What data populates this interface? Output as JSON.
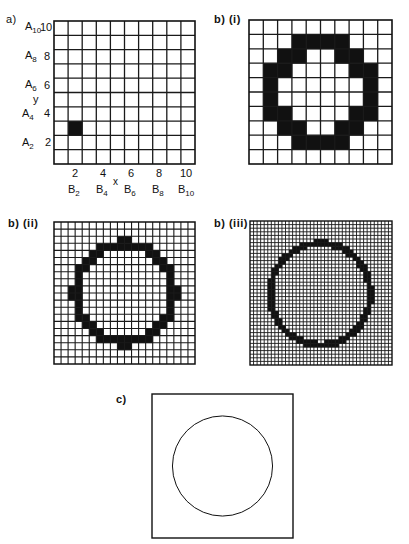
{
  "panels": {
    "a": {
      "label": "a)",
      "grid_size": 10,
      "y_axis": {
        "title": "y",
        "ticks": [
          {
            "value": "10",
            "name": "A",
            "sub": "10"
          },
          {
            "value": "8",
            "name": "A",
            "sub": "8"
          },
          {
            "value": "6",
            "name": "A",
            "sub": "6"
          },
          {
            "value": "4",
            "name": "A",
            "sub": "4"
          },
          {
            "value": "2",
            "name": "A",
            "sub": "2"
          }
        ]
      },
      "x_axis": {
        "title": "x",
        "ticks": [
          {
            "value": "2",
            "name": "B",
            "sub": "2"
          },
          {
            "value": "4",
            "name": "B",
            "sub": "4"
          },
          {
            "value": "6",
            "name": "B",
            "sub": "6"
          },
          {
            "value": "8",
            "name": "B",
            "sub": "8"
          },
          {
            "value": "10",
            "name": "B",
            "sub": "10"
          }
        ]
      },
      "filled_cells": [
        [
          2,
          3
        ]
      ]
    },
    "b1": {
      "label": "b) (i)",
      "grid_size": 10,
      "filled_rows": [
        [],
        [
          3,
          4,
          5,
          6
        ],
        [
          2,
          3,
          6,
          7
        ],
        [
          1,
          2,
          7,
          8
        ],
        [
          1,
          8
        ],
        [
          1,
          8
        ],
        [
          1,
          2,
          7,
          8
        ],
        [
          2,
          3,
          6,
          7
        ],
        [
          3,
          4,
          5,
          6
        ],
        []
      ]
    },
    "b2": {
      "label": "b) (ii)",
      "grid_size": 20,
      "filled_rows": [
        [],
        [],
        [
          9,
          10
        ],
        [
          6,
          7,
          8,
          9,
          10,
          11,
          12,
          13
        ],
        [
          5,
          6,
          13,
          14
        ],
        [
          4,
          5,
          14,
          15
        ],
        [
          3,
          4,
          15,
          16
        ],
        [
          3,
          16
        ],
        [
          3,
          16
        ],
        [
          2,
          3,
          16,
          17
        ],
        [
          2,
          3,
          16,
          17
        ],
        [
          3,
          16
        ],
        [
          3,
          16
        ],
        [
          3,
          4,
          15,
          16
        ],
        [
          4,
          5,
          14,
          15
        ],
        [
          5,
          6,
          13,
          14
        ],
        [
          6,
          7,
          8,
          9,
          10,
          11,
          12,
          13
        ],
        [
          9,
          10
        ],
        [],
        []
      ]
    },
    "b3": {
      "label": "b) (iii)",
      "grid_size": 40,
      "circle": {
        "center_col": 19.8,
        "center_row": 20.3,
        "radius_cells": 14.1,
        "thickness_cells": 1.15
      }
    },
    "c": {
      "label": "c)",
      "circle": {
        "cx_frac": 0.5,
        "cy_frac": 0.5,
        "r_frac": 0.355
      }
    }
  },
  "colors": {
    "ink": "#111111",
    "grid_line": "#1a1a1a",
    "background": "#ffffff"
  }
}
